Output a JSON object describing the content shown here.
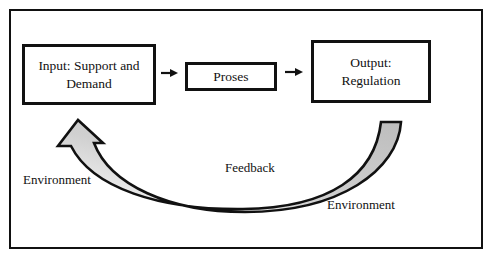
{
  "diagram": {
    "type": "flow-with-feedback",
    "title": "",
    "nodes": [
      {
        "id": "input",
        "label_line1": "Input: Support and",
        "label_line2": "Demand"
      },
      {
        "id": "proses",
        "label_line1": "Proses"
      },
      {
        "id": "output",
        "label_line1": "Output:",
        "label_line2": "Regulation"
      }
    ],
    "edges": [
      {
        "from": "input",
        "to": "proses",
        "style": "small-arrow"
      },
      {
        "from": "proses",
        "to": "output",
        "style": "small-arrow"
      },
      {
        "from": "output",
        "to": "input",
        "style": "curved-block-arrow",
        "label": "Feedback"
      }
    ],
    "labels": {
      "feedback": "Feedback",
      "environment_left": "Environment",
      "environment_right": "Environment"
    },
    "colors": {
      "stroke": "#111111",
      "arrow_tail_fill": "#bdbdbd",
      "arrow_head_fill": "#ffffff",
      "background": "#ffffff"
    }
  }
}
